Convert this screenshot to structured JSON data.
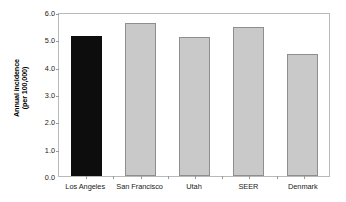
{
  "chart_data": {
    "type": "bar",
    "title": "",
    "xlabel": "",
    "ylabel": "Annual incidence (per 100,000)",
    "ylabel_line1": "Annual incidence",
    "ylabel_line2": "(per 100,000)",
    "categories": [
      "Los Angeles",
      "San Francisco",
      "Utah",
      "SEER",
      "Denmark"
    ],
    "values": [
      5.12,
      5.6,
      5.08,
      5.47,
      4.47
    ],
    "series": [
      {
        "name": "Annual incidence",
        "values": [
          5.12,
          5.6,
          5.08,
          5.47,
          4.47
        ]
      }
    ],
    "ylim": [
      0.0,
      6.0
    ],
    "ytick_values": [
      0.0,
      1.0,
      2.0,
      3.0,
      4.0,
      5.0,
      6.0
    ],
    "ytick_labels": [
      "0.0",
      "1.0",
      "2.0",
      "3.0",
      "4.0",
      "5.0",
      "6.0"
    ],
    "grid": false,
    "legend": null,
    "legend_position": "none",
    "bar_colors": [
      "#0d0d0d",
      "#c9c9c9",
      "#c9c9c9",
      "#c9c9c9",
      "#c9c9c9"
    ],
    "bar_edge_color": "#8e8e8e",
    "highlight_category": "Los Angeles",
    "frame_color": "#b9b9b9",
    "background_color": "#ffffff"
  }
}
